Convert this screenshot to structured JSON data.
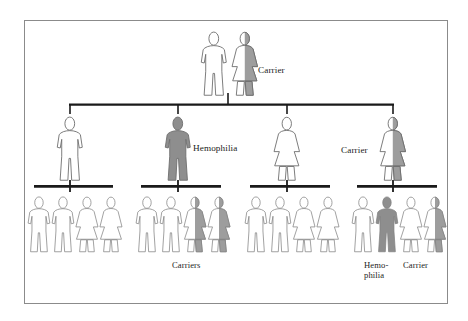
{
  "figure": {
    "frame": {
      "border_color": "#8b8b8b",
      "background": "#ffffff"
    }
  },
  "legend_colors": {
    "unaffected_fill": "#ffffff",
    "affected_fill": "#8e8e8e",
    "carrier_fill": "#9d9d9d",
    "outline": "#6e6e6e",
    "connector": "#1a1a1a",
    "text": "#1d1d1d"
  },
  "labels": {
    "carrier": "Carrier",
    "carriers": "Carriers",
    "hemophilia": "Hemophilia",
    "hemophilia_line1": "Hemo-",
    "hemophilia_line2": "philia"
  },
  "generations": [
    {
      "id": "generation-1",
      "name": "parents",
      "individuals": [
        {
          "id": "g1-father",
          "sex": "male",
          "status": "unaffected",
          "label": ""
        },
        {
          "id": "g1-mother",
          "sex": "female",
          "status": "carrier",
          "label": "Carrier"
        }
      ]
    },
    {
      "id": "generation-2",
      "name": "children",
      "individuals": [
        {
          "id": "g2-1",
          "sex": "male",
          "status": "unaffected",
          "label": ""
        },
        {
          "id": "g2-2",
          "sex": "male",
          "status": "affected",
          "label": "Hemophilia"
        },
        {
          "id": "g2-3",
          "sex": "female",
          "status": "unaffected",
          "label": ""
        },
        {
          "id": "g2-4",
          "sex": "female",
          "status": "carrier",
          "label": "Carrier"
        }
      ]
    },
    {
      "id": "generation-3",
      "name": "grandchildren",
      "sibships": [
        {
          "id": "sibship-1",
          "parent": "g2-1",
          "label": "",
          "individuals": [
            {
              "id": "g3-1-1",
              "sex": "male",
              "status": "unaffected"
            },
            {
              "id": "g3-1-2",
              "sex": "male",
              "status": "unaffected"
            },
            {
              "id": "g3-1-3",
              "sex": "female",
              "status": "unaffected"
            },
            {
              "id": "g3-1-4",
              "sex": "female",
              "status": "unaffected"
            }
          ]
        },
        {
          "id": "sibship-2",
          "parent": "g2-2",
          "label": "Carriers",
          "individuals": [
            {
              "id": "g3-2-1",
              "sex": "male",
              "status": "unaffected"
            },
            {
              "id": "g3-2-2",
              "sex": "male",
              "status": "unaffected"
            },
            {
              "id": "g3-2-3",
              "sex": "female",
              "status": "carrier"
            },
            {
              "id": "g3-2-4",
              "sex": "female",
              "status": "carrier"
            }
          ]
        },
        {
          "id": "sibship-3",
          "parent": "g2-3",
          "label": "",
          "individuals": [
            {
              "id": "g3-3-1",
              "sex": "male",
              "status": "unaffected"
            },
            {
              "id": "g3-3-2",
              "sex": "male",
              "status": "unaffected"
            },
            {
              "id": "g3-3-3",
              "sex": "female",
              "status": "unaffected"
            },
            {
              "id": "g3-3-4",
              "sex": "female",
              "status": "unaffected"
            }
          ]
        },
        {
          "id": "sibship-4",
          "parent": "g2-4",
          "label": "",
          "individuals": [
            {
              "id": "g3-4-1",
              "sex": "male",
              "status": "unaffected"
            },
            {
              "id": "g3-4-2",
              "sex": "male",
              "status": "affected",
              "label": "Hemo- philia"
            },
            {
              "id": "g3-4-3",
              "sex": "female",
              "status": "unaffected"
            },
            {
              "id": "g3-4-4",
              "sex": "female",
              "status": "carrier",
              "label": "Carrier"
            }
          ]
        }
      ]
    }
  ]
}
